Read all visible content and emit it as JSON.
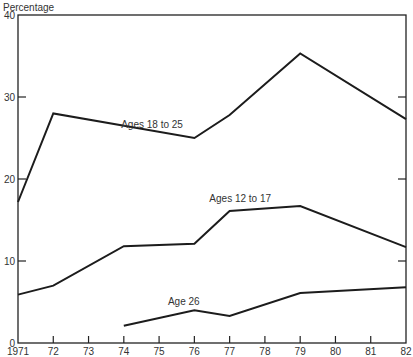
{
  "chart_data": {
    "type": "line",
    "title": "",
    "ylabel": "Percentage",
    "xlabel": "",
    "ylim": [
      0,
      40
    ],
    "yticks": [
      0,
      10,
      20,
      30,
      40
    ],
    "xlim": [
      1971,
      1982
    ],
    "x": [
      1971,
      1972,
      1973,
      1974,
      1975,
      1976,
      1977,
      1978,
      1979,
      1980,
      1981,
      1982
    ],
    "xtick_labels": [
      "1971",
      "72",
      "73",
      "74",
      "75",
      "76",
      "77",
      "78",
      "79",
      "80",
      "81",
      "82"
    ],
    "grid": false,
    "legend": "inline labels",
    "series": [
      {
        "name": "Ages 18 to 25",
        "points": [
          [
            1971,
            17.2
          ],
          [
            1972,
            28.0
          ],
          [
            1976,
            25.0
          ],
          [
            1977,
            27.8
          ],
          [
            1979,
            35.3
          ],
          [
            1982,
            27.3
          ]
        ],
        "label_pos": [
          1974.8,
          26.2
        ]
      },
      {
        "name": "Ages 12 to 17",
        "points": [
          [
            1971,
            5.9
          ],
          [
            1972,
            7.0
          ],
          [
            1974,
            11.8
          ],
          [
            1976,
            12.1
          ],
          [
            1977,
            16.1
          ],
          [
            1979,
            16.7
          ],
          [
            1982,
            11.7
          ]
        ],
        "label_pos": [
          1977.3,
          17.2
        ]
      },
      {
        "name": "Age 26",
        "points": [
          [
            1974,
            2.1
          ],
          [
            1976,
            4.0
          ],
          [
            1977,
            3.3
          ],
          [
            1979,
            6.1
          ],
          [
            1982,
            6.8
          ]
        ],
        "label_pos": [
          1975.7,
          4.6
        ]
      }
    ]
  }
}
